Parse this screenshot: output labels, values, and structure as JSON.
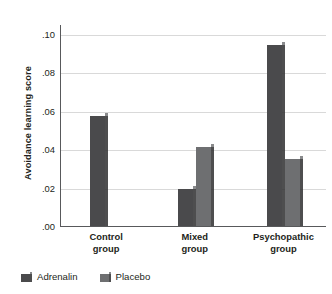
{
  "chart_data": {
    "type": "bar",
    "title": "",
    "subtitle": "",
    "xlabel": "",
    "ylabel": "Avoidance learning score",
    "categories": [
      "Control group",
      "Mixed group",
      "Psychopathic group"
    ],
    "category_lines": [
      [
        "Control",
        "group"
      ],
      [
        "Mixed",
        "group"
      ],
      [
        "Psychopathic",
        "group"
      ]
    ],
    "series": [
      {
        "name": "Adrenalin",
        "color": "#4a4a4c",
        "values": [
          0.057,
          0.019,
          0.094
        ]
      },
      {
        "name": "Placebo",
        "color": "#6e6f71",
        "values": [
          0.0,
          0.041,
          0.035
        ]
      }
    ],
    "ylim": [
      0.0,
      0.105
    ],
    "yticks": [
      0.0,
      0.02,
      0.04,
      0.06,
      0.08,
      0.1
    ],
    "ytick_labels": [
      ".00",
      ".02",
      ".04",
      ".06",
      ".08",
      ".10"
    ],
    "grid": true,
    "grid_color": "#d9d9d9",
    "axis_color": "#58595b",
    "legend_position": "bottom-left",
    "legend": [
      "Adrenalin",
      "Placebo"
    ],
    "background": "#ffffff"
  }
}
